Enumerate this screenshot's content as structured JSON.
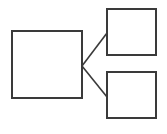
{
  "diagram": {
    "type": "tree",
    "stroke_color": "#3a3a3a",
    "background": "#ffffff",
    "nodes": [
      {
        "id": "root",
        "label": "",
        "x": 12,
        "y": 31,
        "w": 70,
        "h": 67
      },
      {
        "id": "child-top",
        "label": "",
        "x": 107,
        "y": 9,
        "w": 49,
        "h": 46
      },
      {
        "id": "child-bottom",
        "label": "",
        "x": 107,
        "y": 72,
        "w": 49,
        "h": 46
      }
    ],
    "edges": [
      {
        "from": "root",
        "to": "child-top",
        "x1": 82,
        "y1": 66,
        "x2": 107,
        "y2": 33
      },
      {
        "from": "root",
        "to": "child-bottom",
        "x1": 82,
        "y1": 66,
        "x2": 107,
        "y2": 97
      }
    ]
  }
}
